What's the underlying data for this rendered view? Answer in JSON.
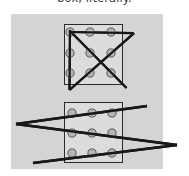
{
  "caption": {
    "text": "box, literally."
  },
  "figure": {
    "name": "nine-dots-puzzle-illustration",
    "panel_background": "#d4d4d4",
    "page_background": "#ffffff",
    "box_fill": "#dcdcdc",
    "box_stroke": "#2a2a2a",
    "dot_fill": "#b4b4b4",
    "dot_stroke": "#5a5a5a",
    "line_color": "#181818",
    "panels": [
      {
        "name": "top-panel-four-line-solution",
        "box": {
          "x": 64,
          "y": 24,
          "width": 58,
          "height": 60
        },
        "dots": [
          {
            "cx": 70,
            "cy": 32
          },
          {
            "cx": 90,
            "cy": 32
          },
          {
            "cx": 111,
            "cy": 32
          },
          {
            "cx": 70,
            "cy": 53
          },
          {
            "cx": 90,
            "cy": 53
          },
          {
            "cx": 111,
            "cy": 53
          },
          {
            "cx": 70,
            "cy": 73
          },
          {
            "cx": 90,
            "cy": 73
          },
          {
            "cx": 111,
            "cy": 73
          }
        ],
        "path_points": [
          {
            "x": 70,
            "y": 32
          },
          {
            "x": 134,
            "y": 33
          },
          {
            "x": 70,
            "y": 90
          },
          {
            "x": 70,
            "y": 30
          },
          {
            "x": 126,
            "y": 88
          }
        ]
      },
      {
        "name": "bottom-panel-three-line-solution",
        "box": {
          "x": 64,
          "y": 102,
          "width": 58,
          "height": 60
        },
        "dots": [
          {
            "cx": 72,
            "cy": 113
          },
          {
            "cx": 92,
            "cy": 113
          },
          {
            "cx": 112,
            "cy": 113
          },
          {
            "cx": 72,
            "cy": 133
          },
          {
            "cx": 92,
            "cy": 133
          },
          {
            "cx": 112,
            "cy": 133
          },
          {
            "cx": 72,
            "cy": 153
          },
          {
            "cx": 92,
            "cy": 153
          },
          {
            "cx": 112,
            "cy": 153
          }
        ],
        "path_points": [
          {
            "x": 147,
            "y": 106
          },
          {
            "x": 16,
            "y": 124
          },
          {
            "x": 177,
            "y": 145
          },
          {
            "x": 33,
            "y": 163
          }
        ]
      }
    ],
    "dot_radius": 4.1,
    "dot_count": 9,
    "grid": "3x3"
  }
}
